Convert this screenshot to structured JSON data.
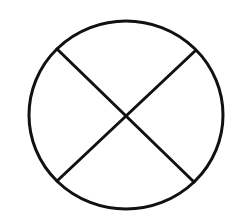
{
  "diagram": {
    "shape": "circle-with-x",
    "stroke_color": "#111111",
    "background": "#ffffff",
    "stroke_width": 3,
    "circle": {
      "cx": 126,
      "cy": 115,
      "rx": 97,
      "ry": 94
    },
    "lines": [
      {
        "x1": 57,
        "y1": 49,
        "x2": 194,
        "y2": 182
      },
      {
        "x1": 195,
        "y1": 51,
        "x2": 57,
        "y2": 181
      }
    ]
  }
}
